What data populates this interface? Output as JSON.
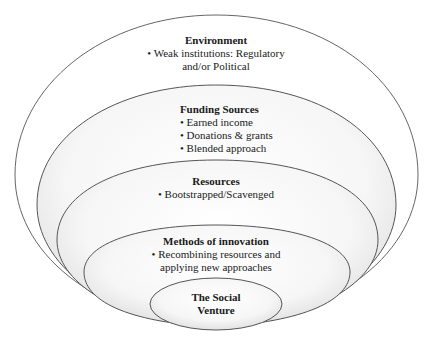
{
  "diagram": {
    "type": "nested-ellipses",
    "layers": [
      {
        "id": "environment",
        "title": "Environment",
        "items": [
          "• Weak institutions: Regulatory",
          "and/or Political"
        ]
      },
      {
        "id": "funding",
        "title": "Funding Sources",
        "items": [
          "• Earned income",
          "• Donations & grants",
          "• Blended approach"
        ]
      },
      {
        "id": "resources",
        "title": "Resources",
        "items": [
          "• Bootstrapped/Scavenged"
        ]
      },
      {
        "id": "methods",
        "title": "Methods of innovation",
        "items": [
          "• Recombining resources and",
          "applying new approaches"
        ]
      },
      {
        "id": "venture",
        "title_lines": [
          "The Social",
          "Venture"
        ]
      }
    ],
    "colors": {
      "stroke": "#555555",
      "fill_outer": "#ffffff",
      "fill_inner_light": "#fbfbfb",
      "fill_inner_shade": "#e6e6e6",
      "text": "#1a1a1a"
    }
  }
}
